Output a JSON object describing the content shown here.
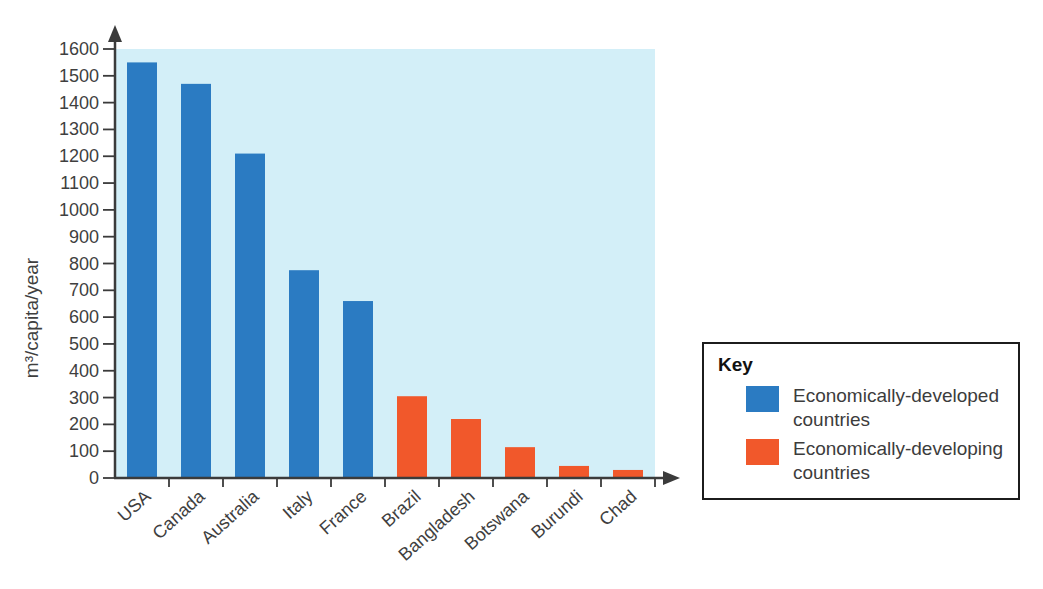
{
  "chart_data": {
    "type": "bar",
    "title": "",
    "xlabel": "",
    "ylabel": "m³/capita/year",
    "ylim": [
      0,
      1600
    ],
    "ytick_step": 100,
    "categories": [
      "USA",
      "Canada",
      "Australia",
      "Italy",
      "France",
      "Brazil",
      "Bangladesh",
      "Botswana",
      "Burundi",
      "Chad"
    ],
    "values": [
      1550,
      1470,
      1210,
      775,
      660,
      305,
      220,
      115,
      45,
      30
    ],
    "bar_groups": [
      "developed",
      "developed",
      "developed",
      "developed",
      "developed",
      "developing",
      "developing",
      "developing",
      "developing",
      "developing"
    ],
    "colors": {
      "developed": "#2B7BC2",
      "developing": "#F1582B"
    },
    "plot_background": "#D3EFF8",
    "axis_color": "#3B3B3B",
    "grid": false,
    "legend_position": "right"
  },
  "legend": {
    "title": "Key",
    "items": [
      {
        "label": "Economically-developed countries",
        "series": "developed",
        "color": "#2B7BC2"
      },
      {
        "label": "Economically-developing countries",
        "series": "developing",
        "color": "#F1582B"
      }
    ]
  }
}
